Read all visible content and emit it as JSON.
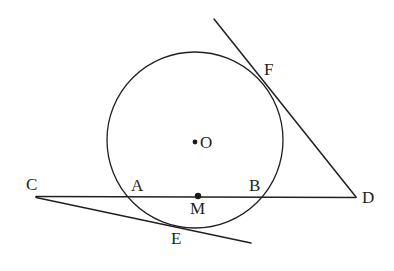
{
  "figure": {
    "kind": "geometry-diagram",
    "background_color": "#ffffff",
    "stroke_color": "#231f20",
    "canvas": {
      "width": 394,
      "height": 271
    }
  },
  "circle": {
    "name": "circle-O",
    "center_x": 195,
    "center_y": 140,
    "radius": 88,
    "stroke_width": 1.3
  },
  "lines": [
    {
      "name": "line-CD",
      "x1": 36,
      "y1": 196.5,
      "x2": 356,
      "y2": 197.5,
      "stroke_width": 1.5
    },
    {
      "name": "line-CE-right",
      "x1": 36,
      "y1": 197.5,
      "x2": 251,
      "y2": 243,
      "stroke_width": 1.5
    },
    {
      "name": "line-FD",
      "x1": 214,
      "y1": 19,
      "x2": 356,
      "y2": 197,
      "stroke_width": 1.5
    }
  ],
  "dots": [
    {
      "name": "center-dot-O",
      "cx": 195,
      "cy": 142,
      "r": 2.4
    },
    {
      "name": "point-dot-M",
      "cx": 198,
      "cy": 196,
      "r": 3.2
    }
  ],
  "labels": {
    "O": {
      "text": "O",
      "x": 200,
      "y": 134
    },
    "C": {
      "text": "C",
      "x": 26,
      "y": 176
    },
    "A": {
      "text": "A",
      "x": 131,
      "y": 177
    },
    "M": {
      "text": "M",
      "x": 190,
      "y": 200
    },
    "B": {
      "text": "B",
      "x": 249,
      "y": 177
    },
    "D": {
      "text": "D",
      "x": 362,
      "y": 189
    },
    "F": {
      "text": "F",
      "x": 264,
      "y": 61
    },
    "E": {
      "text": "E",
      "x": 171,
      "y": 230
    }
  }
}
